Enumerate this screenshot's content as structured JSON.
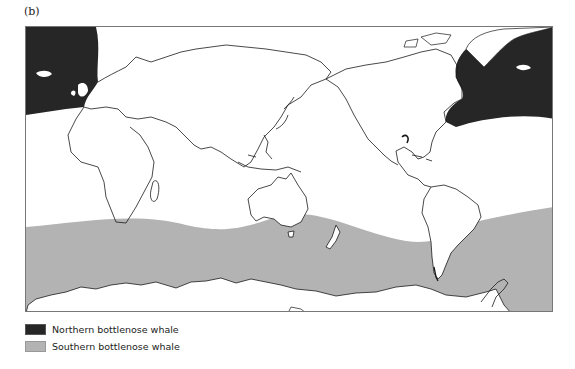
{
  "figure": {
    "panel_label": "(b)",
    "type": "world distribution map (Pacific-centred)"
  },
  "legend": {
    "items": [
      {
        "label": "Northern bottlenose whale",
        "color": "#262626"
      },
      {
        "label": "Southern bottlenose whale",
        "color": "#b3b3b3"
      }
    ]
  },
  "colors": {
    "frame": "#777777",
    "coastline": "#1a1a1a",
    "land": "#ffffff",
    "ocean": "#ffffff",
    "northern_range": "#262626",
    "southern_range": "#b3b3b3"
  },
  "map": {
    "ranges": [
      {
        "species": "Northern bottlenose whale",
        "region": "North Atlantic (both map edges)"
      },
      {
        "species": "Southern bottlenose whale",
        "region": "Southern Ocean circumpolar band to Antarctica"
      }
    ]
  }
}
